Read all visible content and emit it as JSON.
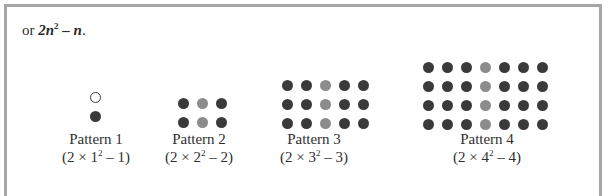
{
  "intro": {
    "prefix": "or ",
    "expr_coef_var": "2n",
    "expr_exp": "2",
    "expr_rest": " – n",
    "suffix": "."
  },
  "patterns": [
    {
      "name": "Pattern 1",
      "formula_pre": "(2 × 1",
      "formula_exp": "2",
      "formula_post": " – 1)",
      "rows": 2,
      "cols": 1,
      "gray_col": null,
      "hollow": [
        [
          0,
          0
        ]
      ]
    },
    {
      "name": "Pattern 2",
      "formula_pre": "(2 × 2",
      "formula_exp": "2",
      "formula_post": " – 2)",
      "rows": 2,
      "cols": 3,
      "gray_col": 1
    },
    {
      "name": "Pattern 3",
      "formula_pre": "(2 × 3",
      "formula_exp": "2",
      "formula_post": " – 3)",
      "rows": 3,
      "cols": 5,
      "gray_col": 2
    },
    {
      "name": "Pattern 4",
      "formula_pre": "(2 × 4",
      "formula_exp": "2",
      "formula_post": " – 4)",
      "rows": 4,
      "cols": 7,
      "gray_col": 3
    }
  ],
  "colors": {
    "dot_dark": "#3a3a3a",
    "dot_gray": "#8c8c8c",
    "border": "#a6a6a6"
  }
}
